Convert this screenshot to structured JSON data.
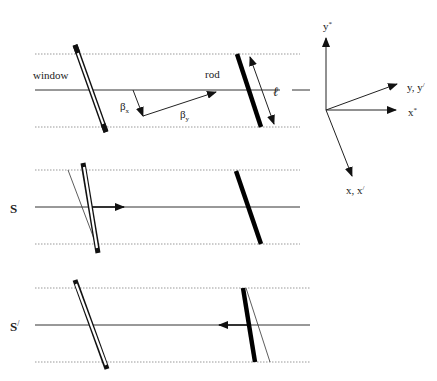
{
  "figure": {
    "panel_top": {
      "window_label": "window",
      "rod_label": "rod",
      "length_label": "ℓ",
      "beta_x_label": "β",
      "beta_x_sub": "x",
      "beta_y_label": "β",
      "beta_y_sub": "y"
    },
    "panel_middle": {
      "frame_label": "S"
    },
    "panel_bottom": {
      "frame_label": "S",
      "frame_prime": "/"
    },
    "axes": {
      "y_star": "y",
      "y_star_sup": "*",
      "x_star": "x",
      "x_star_sup": "*",
      "y_yprime": "y, y",
      "y_yprime_sup": "/",
      "x_xprime": "x, x",
      "x_xprime_sup": "/"
    }
  }
}
